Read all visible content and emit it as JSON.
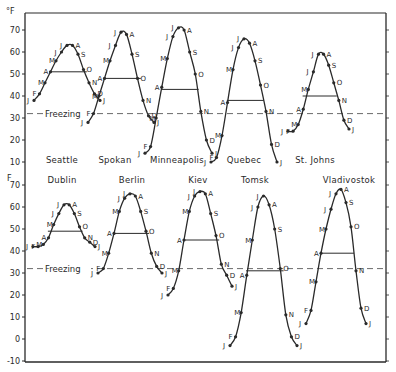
{
  "chart_data": {
    "type": "line",
    "title": "",
    "unit_label": "°F",
    "freezing_label": "Freezing",
    "freezing_value": 32,
    "month_labels": [
      "J",
      "F",
      "M",
      "A",
      "M",
      "J",
      "J",
      "A",
      "S",
      "O",
      "N",
      "D",
      "J"
    ],
    "panels": [
      {
        "name": "top",
        "ylabel": "°F",
        "yticks": [
          10,
          20,
          30,
          40,
          50,
          60,
          70
        ],
        "ylim": [
          10,
          72
        ],
        "cities": [
          {
            "name": "Seattle",
            "values": [
              38,
              41,
              46,
              51,
              56,
              60,
              63,
              63,
              59,
              52,
              46,
              41,
              38
            ],
            "mean": 51
          },
          {
            "name": "Spokan",
            "values": [
              28,
              32,
              40,
              48,
              56,
              63,
              69,
              68,
              59,
              48,
              38,
              31,
              28
            ],
            "mean": 48
          },
          {
            "name": "Minneapolis",
            "values": [
              14,
              17,
              30,
              44,
              57,
              67,
              71,
              70,
              60,
              50,
              33,
              20,
              14
            ],
            "mean": 43
          },
          {
            "name": "Quebec",
            "values": [
              10,
              12,
              22,
              37,
              52,
              62,
              66,
              64,
              56,
              45,
              33,
              18,
              10
            ],
            "mean": 38
          },
          {
            "name": "St. Johns",
            "values": [
              24,
              24,
              27,
              34,
              43,
              51,
              59,
              59,
              54,
              46,
              38,
              29,
              25
            ],
            "mean": 40
          }
        ]
      },
      {
        "name": "bottom",
        "ylabel": "F",
        "yticks": [
          -10,
          0,
          10,
          20,
          30,
          40,
          50,
          60,
          70
        ],
        "ylim": [
          -10,
          72
        ],
        "cities": [
          {
            "name": "Dublin",
            "values": [
              42,
              42,
              43,
              46,
              52,
              57,
              61,
              61,
              57,
              51,
              46,
              44,
              42
            ],
            "mean": 49
          },
          {
            "name": "Berlin",
            "values": [
              30,
              32,
              39,
              48,
              58,
              64,
              66,
              65,
              58,
              49,
              39,
              33,
              30
            ],
            "mean": 48
          },
          {
            "name": "Kiev",
            "values": [
              20,
              23,
              31,
              45,
              58,
              65,
              67,
              66,
              57,
              47,
              34,
              29,
              24
            ],
            "mean": 45
          },
          {
            "name": "Tomsk",
            "values": [
              -3,
              1,
              12,
              29,
              45,
              60,
              65,
              61,
              50,
              32,
              11,
              1,
              -3
            ],
            "mean": 31
          },
          {
            "name": "Vladivostok",
            "values": [
              7,
              13,
              26,
              39,
              50,
              59,
              66,
              68,
              62,
              51,
              31,
              14,
              7
            ],
            "mean": 39
          }
        ]
      }
    ],
    "grid": false,
    "legend": "none"
  }
}
